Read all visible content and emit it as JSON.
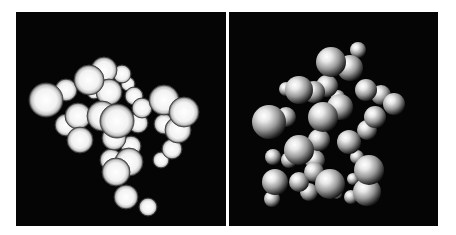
{
  "figure": {
    "panels": [
      {
        "id": "left",
        "description": "Sphere cluster rendered with flat shading and dark outlines",
        "background": "#050505",
        "style": "outlined",
        "spheres": [
          [
            30,
            88,
            17
          ],
          [
            50,
            78,
            11
          ],
          [
            62,
            104,
            13
          ],
          [
            50,
            113,
            11
          ],
          [
            64,
            128,
            13
          ],
          [
            73,
            68,
            15
          ],
          [
            88,
            58,
            13
          ],
          [
            78,
            80,
            7
          ],
          [
            93,
            80,
            13
          ],
          [
            106,
            62,
            9
          ],
          [
            112,
            72,
            7
          ],
          [
            118,
            84,
            9
          ],
          [
            86,
            104,
            15
          ],
          [
            101,
            109,
            17
          ],
          [
            98,
            126,
            12
          ],
          [
            115,
            134,
            10
          ],
          [
            122,
            111,
            10
          ],
          [
            126,
            96,
            10
          ],
          [
            148,
            88,
            15
          ],
          [
            168,
            100,
            15
          ],
          [
            162,
            118,
            13
          ],
          [
            148,
            112,
            10
          ],
          [
            156,
            137,
            10
          ],
          [
            145,
            148,
            8
          ],
          [
            113,
            150,
            14
          ],
          [
            100,
            160,
            14
          ],
          [
            95,
            148,
            11
          ],
          [
            110,
            185,
            12
          ],
          [
            132,
            195,
            9
          ]
        ]
      },
      {
        "id": "right",
        "description": "Same sphere cluster rendered with directional lighting",
        "background": "#050505",
        "style": "shaded",
        "spheres": [
          [
            129,
            38,
            8
          ],
          [
            121,
            56,
            13
          ],
          [
            102,
            50,
            15
          ],
          [
            98,
            74,
            11
          ],
          [
            85,
            80,
            11
          ],
          [
            70,
            78,
            14
          ],
          [
            57,
            77,
            7
          ],
          [
            111,
            95,
            13
          ],
          [
            94,
            105,
            15
          ],
          [
            109,
            85,
            7
          ],
          [
            137,
            78,
            11
          ],
          [
            152,
            83,
            10
          ],
          [
            146,
            105,
            11
          ],
          [
            165,
            92,
            11
          ],
          [
            138,
            118,
            10
          ],
          [
            40,
            110,
            17
          ],
          [
            57,
            105,
            10
          ],
          [
            90,
            128,
            11
          ],
          [
            120,
            130,
            12
          ],
          [
            128,
            145,
            7
          ],
          [
            70,
            138,
            15
          ],
          [
            86,
            148,
            10
          ],
          [
            60,
            148,
            8
          ],
          [
            70,
            170,
            10
          ],
          [
            85,
            160,
            10
          ],
          [
            101,
            172,
            15
          ],
          [
            80,
            180,
            9
          ],
          [
            46,
            170,
            13
          ],
          [
            44,
            145,
            8
          ],
          [
            43,
            187,
            8
          ],
          [
            124,
            167,
            6
          ],
          [
            140,
            158,
            15
          ],
          [
            138,
            180,
            14
          ],
          [
            122,
            185,
            7
          ],
          [
            108,
            182,
            5
          ]
        ]
      }
    ]
  }
}
